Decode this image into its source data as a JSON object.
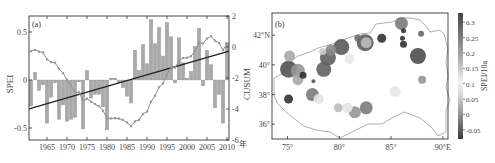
{
  "figure": {
    "panel_a_label": "(a)",
    "panel_b_label": "(b)"
  },
  "chart_data": [
    {
      "type": "bar",
      "panel": "(a)",
      "title": "",
      "xlabel": "年",
      "ylabel": "SPEI",
      "ylabel_right": "CUSUM",
      "ylim": [
        -0.6,
        0.65
      ],
      "ylim_right": [
        -6,
        2
      ],
      "yticks": [
        0.5,
        0,
        -0.5
      ],
      "yticks_right": [
        2,
        0,
        -2,
        -4,
        -6
      ],
      "xticks": [
        1965,
        1970,
        1975,
        1980,
        1985,
        1990,
        1995,
        2000,
        2005,
        2010
      ],
      "grid": false,
      "categories": [
        1961,
        1962,
        1963,
        1964,
        1965,
        1966,
        1967,
        1968,
        1969,
        1970,
        1971,
        1972,
        1973,
        1974,
        1975,
        1976,
        1977,
        1978,
        1979,
        1980,
        1981,
        1982,
        1983,
        1984,
        1985,
        1986,
        1987,
        1988,
        1989,
        1990,
        1991,
        1992,
        1993,
        1994,
        1995,
        1996,
        1997,
        1998,
        1999,
        2000,
        2001,
        2002,
        2003,
        2004,
        2005,
        2006,
        2007,
        2008,
        2009,
        2010
      ],
      "series": [
        {
          "name": "SPEI",
          "kind": "bar",
          "color": "#a9a9a9",
          "values": [
            -0.27,
            0.08,
            -0.11,
            -0.05,
            -0.45,
            -0.18,
            -0.03,
            -0.41,
            -0.26,
            -0.43,
            -0.41,
            -0.39,
            -0.02,
            -0.51,
            0.1,
            -0.19,
            -0.15,
            -0.15,
            -0.28,
            -0.52,
            0.02,
            0.02,
            -0.03,
            -0.08,
            -0.17,
            -0.24,
            0.31,
            0.1,
            0.37,
            0.17,
            0.63,
            0.38,
            0.55,
            0.25,
            0.6,
            0.45,
            -0.03,
            0.44,
            0.18,
            0.02,
            0.09,
            0.35,
            0.54,
            -0.06,
            0.31,
            0.16,
            -0.29,
            -0.15,
            -0.45,
            0.39
          ]
        },
        {
          "name": "CUSUM",
          "kind": "line-markers",
          "axis": "right",
          "color": "#8c8c8c",
          "values": [
            -0.27,
            -0.19,
            -0.3,
            -0.35,
            -0.8,
            -0.98,
            -1.01,
            -1.42,
            -1.68,
            -2.11,
            -2.52,
            -2.91,
            -2.93,
            -3.44,
            -3.34,
            -3.53,
            -3.68,
            -3.83,
            -4.11,
            -4.63,
            -4.61,
            -4.59,
            -4.62,
            -4.7,
            -4.87,
            -5.11,
            -4.8,
            -4.7,
            -4.33,
            -4.16,
            -3.53,
            -3.15,
            -2.6,
            -2.35,
            -1.75,
            -1.3,
            -1.33,
            -0.89,
            -0.71,
            -0.69,
            -0.6,
            -0.25,
            0.29,
            0.23,
            0.54,
            0.7,
            0.41,
            0.26,
            -0.19,
            0.2
          ]
        },
        {
          "name": "Linear trend",
          "kind": "line",
          "color": "#222222",
          "start": [
            1961,
            -0.3
          ],
          "end": [
            2010,
            0.3
          ]
        }
      ]
    },
    {
      "type": "scatter",
      "panel": "(b)",
      "title": "",
      "xlabel": "",
      "ylabel": "",
      "colorbar_label": "SPEI/10a",
      "colorbar_ticks": [
        0.3,
        0.25,
        0.2,
        0.15,
        0.1,
        0.05,
        0,
        -0.05
      ],
      "colorbar_range": [
        -0.08,
        0.33
      ],
      "xticks": [
        "75°",
        "80°",
        "85°",
        "90°E"
      ],
      "yticks": [
        "42°N",
        "40°",
        "38°",
        "36°"
      ],
      "xlim": [
        73.5,
        90.5
      ],
      "ylim": [
        35,
        43.5
      ],
      "points": [
        {
          "lon": 75.2,
          "lat": 40.6,
          "size": 10,
          "value": 0.15
        },
        {
          "lon": 75.1,
          "lat": 39.7,
          "size": 16,
          "value": 0.28
        },
        {
          "lon": 76.0,
          "lat": 39.6,
          "size": 13,
          "value": 0.18
        },
        {
          "lon": 76.0,
          "lat": 39.0,
          "size": 10,
          "value": 0.15
        },
        {
          "lon": 76.5,
          "lat": 39.3,
          "size": 6,
          "value": 0.33
        },
        {
          "lon": 77.5,
          "lat": 38.9,
          "size": 3,
          "value": 0.28
        },
        {
          "lon": 75.1,
          "lat": 37.7,
          "size": 8,
          "value": 0.33
        },
        {
          "lon": 77.4,
          "lat": 38.0,
          "size": 12,
          "value": 0.22
        },
        {
          "lon": 78.0,
          "lat": 37.7,
          "size": 9,
          "value": 0.04
        },
        {
          "lon": 78.5,
          "lat": 39.7,
          "size": 14,
          "value": 0.26
        },
        {
          "lon": 78.9,
          "lat": 40.5,
          "size": 15,
          "value": 0.26
        },
        {
          "lon": 79.2,
          "lat": 41.0,
          "size": 10,
          "value": 0.2
        },
        {
          "lon": 78.4,
          "lat": 40.9,
          "size": 6,
          "value": 0.1
        },
        {
          "lon": 80.2,
          "lat": 41.2,
          "size": 15,
          "value": 0.27
        },
        {
          "lon": 81.0,
          "lat": 40.4,
          "size": 9,
          "value": 0.05
        },
        {
          "lon": 81.8,
          "lat": 41.8,
          "size": 6,
          "value": 0.24
        },
        {
          "lon": 82.5,
          "lat": 41.5,
          "size": 16,
          "value": 0.27
        },
        {
          "lon": 82.6,
          "lat": 41.5,
          "size": 10,
          "value": 0.12
        },
        {
          "lon": 84.1,
          "lat": 41.8,
          "size": 8,
          "value": 0.33
        },
        {
          "lon": 86.0,
          "lat": 42.8,
          "size": 12,
          "value": 0.22
        },
        {
          "lon": 86.2,
          "lat": 42.3,
          "size": 4,
          "value": 0.33
        },
        {
          "lon": 86.2,
          "lat": 41.4,
          "size": 6,
          "value": 0.33
        },
        {
          "lon": 86.1,
          "lat": 41.8,
          "size": 4,
          "value": 0.33
        },
        {
          "lon": 87.9,
          "lat": 42.1,
          "size": 5,
          "value": 0.25
        },
        {
          "lon": 87.6,
          "lat": 40.6,
          "size": 15,
          "value": 0.29
        },
        {
          "lon": 88.0,
          "lat": 39.0,
          "size": 7,
          "value": 0.18
        },
        {
          "lon": 85.4,
          "lat": 38.2,
          "size": 10,
          "value": 0.06
        },
        {
          "lon": 79.9,
          "lat": 37.1,
          "size": 8,
          "value": 0.12
        },
        {
          "lon": 80.8,
          "lat": 37.1,
          "size": 9,
          "value": 0.04
        },
        {
          "lon": 81.5,
          "lat": 36.8,
          "size": 11,
          "value": 0.18
        },
        {
          "lon": 82.6,
          "lat": 37.1,
          "size": 12,
          "value": 0.22
        }
      ]
    }
  ]
}
